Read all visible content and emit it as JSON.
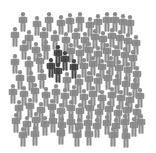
{
  "illustration": {
    "title": "Crowd of people with a highlighted group",
    "colors": {
      "background": "#ffffff",
      "crowd": "#8a8a8a",
      "highlight": "#444444"
    },
    "figure_size": {
      "w": 9,
      "h": 20
    },
    "highlighted": [
      {
        "x": 58,
        "y": 55
      },
      {
        "x": 65,
        "y": 61
      },
      {
        "x": 51,
        "y": 68
      },
      {
        "x": 58,
        "y": 73
      },
      {
        "x": 74,
        "y": 69
      }
    ],
    "crowd": [
      {
        "x": 23,
        "y": 22
      },
      {
        "x": 37,
        "y": 26
      },
      {
        "x": 49,
        "y": 22
      },
      {
        "x": 61,
        "y": 25
      },
      {
        "x": 70,
        "y": 23
      },
      {
        "x": 80,
        "y": 22
      },
      {
        "x": 90,
        "y": 27
      },
      {
        "x": 98,
        "y": 24
      },
      {
        "x": 107,
        "y": 22
      },
      {
        "x": 115,
        "y": 22
      },
      {
        "x": 123,
        "y": 24
      },
      {
        "x": 130,
        "y": 25
      },
      {
        "x": 15,
        "y": 37
      },
      {
        "x": 29,
        "y": 40
      },
      {
        "x": 44,
        "y": 37
      },
      {
        "x": 55,
        "y": 40
      },
      {
        "x": 66,
        "y": 42
      },
      {
        "x": 76,
        "y": 38
      },
      {
        "x": 85,
        "y": 42
      },
      {
        "x": 95,
        "y": 39
      },
      {
        "x": 103,
        "y": 41
      },
      {
        "x": 112,
        "y": 38
      },
      {
        "x": 120,
        "y": 40
      },
      {
        "x": 128,
        "y": 43
      },
      {
        "x": 136,
        "y": 45
      },
      {
        "x": 24,
        "y": 50
      },
      {
        "x": 36,
        "y": 52
      },
      {
        "x": 46,
        "y": 50
      },
      {
        "x": 71,
        "y": 53
      },
      {
        "x": 80,
        "y": 55
      },
      {
        "x": 89,
        "y": 52
      },
      {
        "x": 98,
        "y": 56
      },
      {
        "x": 107,
        "y": 53
      },
      {
        "x": 116,
        "y": 55
      },
      {
        "x": 125,
        "y": 57
      },
      {
        "x": 133,
        "y": 60
      },
      {
        "x": 15,
        "y": 64
      },
      {
        "x": 29,
        "y": 66
      },
      {
        "x": 40,
        "y": 63
      },
      {
        "x": 84,
        "y": 68
      },
      {
        "x": 93,
        "y": 66
      },
      {
        "x": 102,
        "y": 69
      },
      {
        "x": 111,
        "y": 66
      },
      {
        "x": 119,
        "y": 70
      },
      {
        "x": 128,
        "y": 72
      },
      {
        "x": 137,
        "y": 76
      },
      {
        "x": 20,
        "y": 80
      },
      {
        "x": 31,
        "y": 81
      },
      {
        "x": 42,
        "y": 79
      },
      {
        "x": 67,
        "y": 82
      },
      {
        "x": 79,
        "y": 84
      },
      {
        "x": 89,
        "y": 81
      },
      {
        "x": 98,
        "y": 83
      },
      {
        "x": 108,
        "y": 80
      },
      {
        "x": 117,
        "y": 84
      },
      {
        "x": 126,
        "y": 86
      },
      {
        "x": 135,
        "y": 88
      },
      {
        "x": 13,
        "y": 94
      },
      {
        "x": 24,
        "y": 96
      },
      {
        "x": 35,
        "y": 93
      },
      {
        "x": 46,
        "y": 97
      },
      {
        "x": 56,
        "y": 94
      },
      {
        "x": 65,
        "y": 98
      },
      {
        "x": 74,
        "y": 95
      },
      {
        "x": 84,
        "y": 99
      },
      {
        "x": 93,
        "y": 96
      },
      {
        "x": 102,
        "y": 100
      },
      {
        "x": 112,
        "y": 97
      },
      {
        "x": 121,
        "y": 100
      },
      {
        "x": 130,
        "y": 102
      },
      {
        "x": 140,
        "y": 98
      },
      {
        "x": 19,
        "y": 110
      },
      {
        "x": 30,
        "y": 108
      },
      {
        "x": 41,
        "y": 112
      },
      {
        "x": 52,
        "y": 109
      },
      {
        "x": 61,
        "y": 113
      },
      {
        "x": 71,
        "y": 110
      },
      {
        "x": 80,
        "y": 113
      },
      {
        "x": 90,
        "y": 110
      },
      {
        "x": 99,
        "y": 114
      },
      {
        "x": 109,
        "y": 111
      },
      {
        "x": 118,
        "y": 115
      },
      {
        "x": 127,
        "y": 112
      },
      {
        "x": 137,
        "y": 114
      },
      {
        "x": 16,
        "y": 123
      },
      {
        "x": 27,
        "y": 126
      },
      {
        "x": 36,
        "y": 122
      },
      {
        "x": 45,
        "y": 126
      },
      {
        "x": 53,
        "y": 123
      },
      {
        "x": 62,
        "y": 127
      },
      {
        "x": 71,
        "y": 124
      },
      {
        "x": 79,
        "y": 128
      },
      {
        "x": 88,
        "y": 125
      },
      {
        "x": 97,
        "y": 128
      },
      {
        "x": 107,
        "y": 125
      },
      {
        "x": 116,
        "y": 128
      },
      {
        "x": 125,
        "y": 124
      },
      {
        "x": 134,
        "y": 127
      },
      {
        "x": 141,
        "y": 124
      },
      {
        "x": 23,
        "y": 137
      },
      {
        "x": 35,
        "y": 136
      },
      {
        "x": 61,
        "y": 135
      },
      {
        "x": 77,
        "y": 137
      },
      {
        "x": 89,
        "y": 136
      },
      {
        "x": 113,
        "y": 137
      },
      {
        "x": 126,
        "y": 138
      }
    ]
  }
}
